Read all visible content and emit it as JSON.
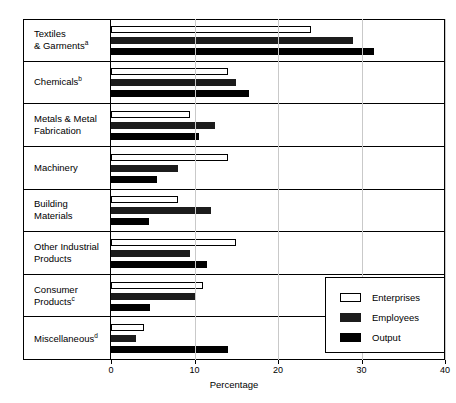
{
  "chart_data": {
    "type": "bar",
    "orientation": "horizontal",
    "title": "",
    "xlabel": "Percentage",
    "ylabel": "",
    "xlim": [
      0,
      40
    ],
    "xticks": [
      0,
      10,
      20,
      30,
      40
    ],
    "xtick_labels": [
      "0",
      "10",
      "20",
      "30",
      "40"
    ],
    "grid": true,
    "legend_position": "bottom-right",
    "categories": [
      "Textiles & Garments",
      "Chemicals",
      "Metals & Metal Fabrication",
      "Machinery",
      "Building Materials",
      "Other Industrial Products",
      "Consumer Products",
      "Miscellaneous"
    ],
    "category_footnotes": [
      "a",
      "b",
      "",
      "",
      "",
      "",
      "c",
      "d"
    ],
    "series": [
      {
        "name": "Enterprises",
        "color": "#ffffff",
        "values": [
          24.0,
          14.0,
          9.5,
          14.0,
          8.0,
          15.0,
          11.0,
          4.0
        ]
      },
      {
        "name": "Employees",
        "color": "#1c1c1c",
        "values": [
          29.0,
          15.0,
          12.5,
          8.0,
          12.0,
          9.5,
          10.0,
          3.0
        ]
      },
      {
        "name": "Output",
        "color": "#000000",
        "values": [
          31.5,
          16.5,
          10.5,
          5.5,
          4.5,
          11.5,
          4.7,
          14.0
        ]
      }
    ]
  },
  "legend": {
    "items": [
      {
        "label": "Enterprises"
      },
      {
        "label": "Employees"
      },
      {
        "label": "Output"
      }
    ]
  },
  "categories_display": [
    {
      "line1": "Textiles",
      "line2": "& Garments",
      "sup": "a"
    },
    {
      "line1": "Chemicals",
      "line2": "",
      "sup": "b"
    },
    {
      "line1": "Metals & Metal",
      "line2": "Fabrication",
      "sup": ""
    },
    {
      "line1": "Machinery",
      "line2": "",
      "sup": ""
    },
    {
      "line1": "Building",
      "line2": "Materials",
      "sup": ""
    },
    {
      "line1": "Other Industrial",
      "line2": "Products",
      "sup": ""
    },
    {
      "line1": "Consumer",
      "line2": "Products",
      "sup": "c"
    },
    {
      "line1": "Miscellaneous",
      "line2": "",
      "sup": "d"
    }
  ]
}
